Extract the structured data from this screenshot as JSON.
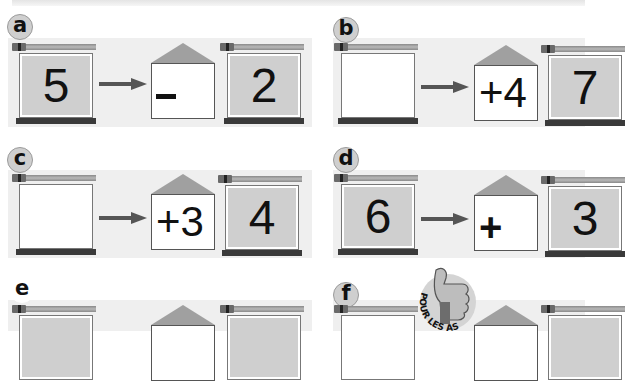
{
  "colors": {
    "panel_background": "#efefef",
    "frame_fill": "#cfcfcf",
    "frame_base": "#3a3a3a",
    "roof": "#a0a0a0",
    "arrow": "#555555"
  },
  "exercises": [
    {
      "label": "a",
      "input": "5",
      "operator": "–",
      "operand": "",
      "output": "2"
    },
    {
      "label": "b",
      "input": "",
      "operator": "+",
      "operand": "4",
      "output": "7"
    },
    {
      "label": "c",
      "input": "",
      "operator": "+",
      "operand": "3",
      "output": "4"
    },
    {
      "label": "d",
      "input": "6",
      "operator": "+",
      "operand": "",
      "output": "3"
    },
    {
      "label": "e",
      "input": "",
      "operator": "",
      "operand": "",
      "output": ""
    },
    {
      "label": "f",
      "input": "",
      "operator": "",
      "operand": "",
      "output": ""
    }
  ],
  "badge": {
    "text": "POUR LES AS",
    "icon": "thumbs-up-icon"
  }
}
